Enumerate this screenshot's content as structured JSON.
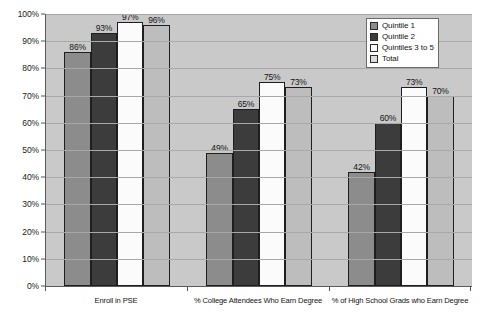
{
  "chart_data": {
    "type": "bar",
    "title": "",
    "xlabel": "",
    "ylabel": "",
    "ylim": [
      0,
      100
    ],
    "ytick_labels": [
      "100%",
      "90%",
      "80%",
      "70%",
      "60%",
      "50%",
      "40%",
      "30%",
      "20%",
      "10%",
      "0%"
    ],
    "ytick_values": [
      100,
      90,
      80,
      70,
      60,
      50,
      40,
      30,
      20,
      10,
      0
    ],
    "grid": true,
    "legend_position": "top-right",
    "categories": [
      "Enroll in PSE",
      "% College Attendees Who Earn Degree",
      "% of High School Grads who Earn Degree"
    ],
    "series": [
      {
        "name": "Quintile 1",
        "color": "#8c8c8c",
        "values": [
          86,
          49,
          42
        ],
        "labels": [
          "86%",
          "49%",
          "42%"
        ]
      },
      {
        "name": "Quintile 2",
        "color": "#3c3c3c",
        "values": [
          93,
          65,
          60
        ],
        "labels": [
          "93%",
          "65%",
          "60%"
        ]
      },
      {
        "name": "Quintiles 3 to 5",
        "color": "#fbfbfb",
        "values": [
          97,
          75,
          73
        ],
        "labels": [
          "97%",
          "75%",
          "73%"
        ]
      },
      {
        "name": "Total",
        "color": "#bdbdbd",
        "values": [
          96,
          73,
          70
        ],
        "labels": [
          "96%",
          "73%",
          "70%"
        ]
      }
    ]
  }
}
